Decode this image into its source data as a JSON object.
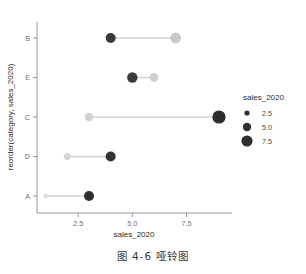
{
  "chart_data": {
    "type": "scatter",
    "subtype": "dumbbell",
    "title": "",
    "xlabel": "sales_2020",
    "ylabel": "reorder(category, sales_2020)",
    "categories": [
      "B",
      "E",
      "C",
      "D",
      "A"
    ],
    "xlim": [
      0.6,
      9.6
    ],
    "xticks": [
      2.5,
      5.0,
      7.5
    ],
    "xticklabels": [
      "2.5",
      "5.0",
      "7.5"
    ],
    "grid": false,
    "series": [
      {
        "name": "start",
        "values": [
          4,
          5,
          3,
          2,
          1
        ],
        "color": "#cccccc"
      },
      {
        "name": "end",
        "values": [
          7,
          6,
          9,
          4,
          3
        ],
        "color": "#3a3a3a"
      }
    ],
    "points": [
      {
        "category": "B",
        "x": 4,
        "color": "#3a3a3a",
        "size": 5.0
      },
      {
        "category": "B",
        "x": 7,
        "color": "#c9c9c9",
        "size": 5.4
      },
      {
        "category": "E",
        "x": 5,
        "color": "#3a3a3a",
        "size": 5.2
      },
      {
        "category": "E",
        "x": 6,
        "color": "#cfcfcf",
        "size": 4.4
      },
      {
        "category": "C",
        "x": 3,
        "color": "#d2d2d2",
        "size": 4.2
      },
      {
        "category": "C",
        "x": 9,
        "color": "#2e2e2e",
        "size": 6.6
      },
      {
        "category": "D",
        "x": 2,
        "color": "#d6d6d6",
        "size": 3.4
      },
      {
        "category": "D",
        "x": 4,
        "color": "#333333",
        "size": 5.0
      },
      {
        "category": "A",
        "x": 1,
        "color": "#dedede",
        "size": 2.2
      },
      {
        "category": "A",
        "x": 3,
        "color": "#2f2f2f",
        "size": 5.0
      }
    ],
    "legend": {
      "title": "sales_2020",
      "position": "right",
      "entries": [
        {
          "label": "2.5",
          "size": 2.6
        },
        {
          "label": "5.0",
          "size": 4.2
        },
        {
          "label": "7.5",
          "size": 5.6
        }
      ]
    }
  },
  "caption": "图 4-6  哑铃图"
}
